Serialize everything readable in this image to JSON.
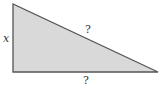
{
  "diagram": {
    "type": "right-triangle",
    "fill_color": "#d9d9d9",
    "stroke_color": "#555555",
    "vertices": {
      "top_left": [
        13,
        4
      ],
      "bottom_left": [
        13,
        72
      ],
      "bottom_right": [
        158,
        72
      ]
    },
    "labels": {
      "vertical_side": "x",
      "hypotenuse": "?",
      "base": "?"
    }
  }
}
